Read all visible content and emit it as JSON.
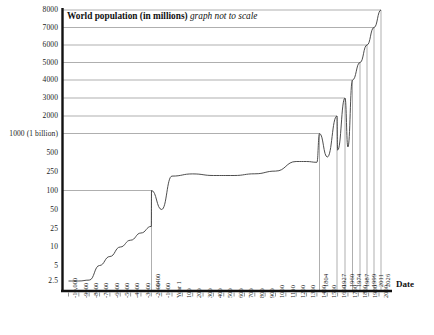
{
  "chart_data": {
    "type": "line",
    "title": "World population (in millions)",
    "subtitle": "graph not to scale",
    "xlabel": "Date",
    "ylabel": "World population (in millions)",
    "grid": true,
    "legend": "none",
    "y_ticks": [
      {
        "label": "2.5",
        "value": 2.5
      },
      {
        "label": "5",
        "value": 5
      },
      {
        "label": "10",
        "value": 10
      },
      {
        "label": "25",
        "value": 25
      },
      {
        "label": "50",
        "value": 50
      },
      {
        "label": "100",
        "value": 100
      },
      {
        "label": "250",
        "value": 250
      },
      {
        "label": "500",
        "value": 500
      },
      {
        "label": "1000 (1 billion)",
        "value": 1000
      },
      {
        "label": "2000",
        "value": 2000
      },
      {
        "label": "3000",
        "value": 3000
      },
      {
        "label": "4000",
        "value": 4000
      },
      {
        "label": "5000",
        "value": 5000
      },
      {
        "label": "6000",
        "value": 6000
      },
      {
        "label": "7000",
        "value": 7000
      },
      {
        "label": "8000",
        "value": 8000
      }
    ],
    "x_ticks": [
      "-10,000",
      "-9000",
      "-8000",
      "-7000",
      "-6000",
      "-5000",
      "-4000",
      "-3000",
      "-2000",
      "-1000",
      "Year 1",
      "100",
      "200",
      "300",
      "400",
      "500",
      "600",
      "700",
      "800",
      "900",
      "1000",
      "1100",
      "1200",
      "1300",
      "1400",
      "1500",
      "1600",
      "1700",
      "1800",
      "1900",
      "2000"
    ],
    "milestone_annotations": [
      {
        "label": "-1400",
        "population": 100
      },
      {
        "label": "1804",
        "population": 1000
      },
      {
        "label": "1927",
        "population": 2000
      },
      {
        "label": "1960",
        "population": 3000
      },
      {
        "label": "1974",
        "population": 4000
      },
      {
        "label": "1987",
        "population": 5000
      },
      {
        "label": "1999",
        "population": 6000
      },
      {
        "label": "2011",
        "population": 7000
      },
      {
        "label": "2026",
        "population": 8000
      }
    ],
    "series": [
      {
        "name": "World population",
        "points": [
          {
            "x": "-10,000",
            "y": 2.5
          },
          {
            "x": "-9000",
            "y": 2.5
          },
          {
            "x": "-8000",
            "y": 2.6
          },
          {
            "x": "-7000",
            "y": 5
          },
          {
            "x": "-6000",
            "y": 7
          },
          {
            "x": "-5000",
            "y": 10
          },
          {
            "x": "-4000",
            "y": 14
          },
          {
            "x": "-3000",
            "y": 20
          },
          {
            "x": "-2000",
            "y": 27
          },
          {
            "x": "-1000",
            "y": 50
          },
          {
            "x": "-1400",
            "y": 100
          },
          {
            "x": "Year 1",
            "y": 200
          },
          {
            "x": "200",
            "y": 223
          },
          {
            "x": "400",
            "y": 206
          },
          {
            "x": "600",
            "y": 206
          },
          {
            "x": "800",
            "y": 224
          },
          {
            "x": "1000",
            "y": 254
          },
          {
            "x": "1200",
            "y": 360
          },
          {
            "x": "1300",
            "y": 360
          },
          {
            "x": "1400",
            "y": 350
          },
          {
            "x": "1500",
            "y": 425
          },
          {
            "x": "1600",
            "y": 545
          },
          {
            "x": "1700",
            "y": 610
          },
          {
            "x": "1804",
            "y": 1000
          },
          {
            "x": "1927",
            "y": 2000
          },
          {
            "x": "1960",
            "y": 3000
          },
          {
            "x": "1974",
            "y": 4000
          },
          {
            "x": "1987",
            "y": 5000
          },
          {
            "x": "1999",
            "y": 6000
          },
          {
            "x": "2011",
            "y": 7000
          },
          {
            "x": "2026",
            "y": 8000
          }
        ]
      }
    ]
  },
  "axis_label": {
    "date": "Date"
  }
}
